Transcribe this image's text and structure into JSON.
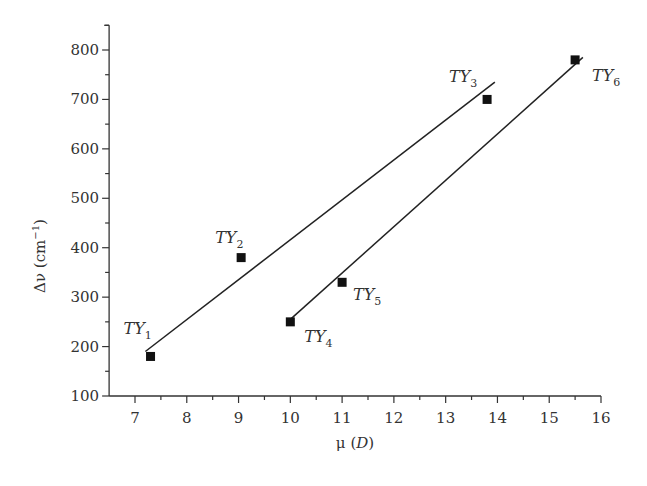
{
  "chart_data": {
    "type": "scatter",
    "title": "",
    "xlabel": "μ (D)",
    "ylabel": "Δν (cm⁻¹)",
    "xlim": [
      6.5,
      16
    ],
    "ylim": [
      100,
      850
    ],
    "x_ticks": [
      7,
      8,
      9,
      10,
      11,
      12,
      13,
      14,
      15,
      16
    ],
    "y_ticks": [
      100,
      200,
      300,
      400,
      500,
      600,
      700,
      800
    ],
    "grid": false,
    "legend": null,
    "series": [
      {
        "name": "Series 1 (TY1–TY3)",
        "marker": "square",
        "points": [
          {
            "label": "TY1",
            "x": 7.3,
            "y": 180
          },
          {
            "label": "TY2",
            "x": 9.05,
            "y": 380
          },
          {
            "label": "TY3",
            "x": 13.8,
            "y": 700
          }
        ],
        "fit_line": {
          "x": [
            7.2,
            13.95
          ],
          "y": [
            190,
            735
          ]
        }
      },
      {
        "name": "Series 2 (TY4–TY6)",
        "marker": "square",
        "points": [
          {
            "label": "TY4",
            "x": 10.0,
            "y": 250
          },
          {
            "label": "TY5",
            "x": 11.0,
            "y": 330
          },
          {
            "label": "TY6",
            "x": 15.5,
            "y": 780
          }
        ],
        "fit_line": {
          "x": [
            10.0,
            15.65
          ],
          "y": [
            255,
            785
          ]
        }
      }
    ]
  },
  "labels": {
    "xlabel_mu": "μ (",
    "xlabel_D": "D",
    "xlabel_close": ")",
    "ylabel_main": "Δν (cm",
    "ylabel_sup": "−1",
    "ylabel_close": ")",
    "point_prefix": "TY"
  }
}
